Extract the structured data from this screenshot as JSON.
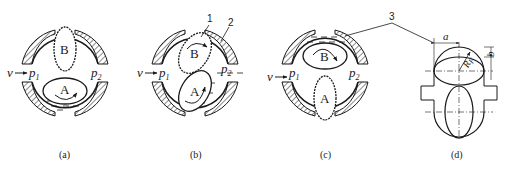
{
  "figure": {
    "panels": [
      {
        "id": "a",
        "caption": "(a)",
        "rotor_top": "B",
        "rotor_bottom": "A",
        "inlet_velocity": "v",
        "p_in": "p",
        "p_in_sub": "1",
        "p_out": "p",
        "p_out_sub": "2"
      },
      {
        "id": "b",
        "caption": "(b)",
        "rotor_top": "B",
        "rotor_bottom": "A",
        "inlet_velocity": "v",
        "p_in": "p",
        "p_in_sub": "1",
        "p_out": "p",
        "p_out_sub": "2",
        "callout_1": "1",
        "callout_2": "2"
      },
      {
        "id": "c",
        "caption": "(c)",
        "rotor_top": "B",
        "rotor_bottom": "A",
        "inlet_velocity": "v",
        "p_in": "p",
        "p_in_sub": "1",
        "p_out": "p",
        "p_out_sub": "2",
        "callout_3": "3"
      },
      {
        "id": "d",
        "caption": "(d)",
        "dim_a": "a",
        "dim_b": "b",
        "dim_r": "R",
        "dim_r_sub": "F"
      }
    ]
  }
}
